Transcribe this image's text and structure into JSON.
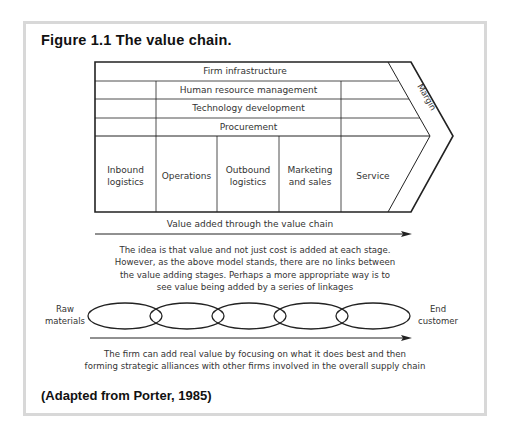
{
  "figure": {
    "title": "Figure 1.1  The value chain.",
    "source": "(Adapted from Porter, 1985)"
  },
  "value_chain": {
    "support_activities": [
      "Firm infrastructure",
      "Human resource management",
      "Technology development",
      "Procurement"
    ],
    "primary_activities": [
      {
        "line1": "Inbound",
        "line2": "logistics"
      },
      {
        "line1": "Operations",
        "line2": ""
      },
      {
        "line1": "Outbound",
        "line2": "logistics"
      },
      {
        "line1": "Marketing",
        "line2": "and sales"
      },
      {
        "line1": "Service",
        "line2": ""
      }
    ],
    "margin_label": "Margin",
    "arrow_label": "Value added through the value chain"
  },
  "explanation": {
    "lines": [
      "The idea is that value and not just cost is added at each stage.",
      "However, as the above model stands, there are no links between",
      "the value adding stages. Perhaps a more appropriate way is to",
      "see value being added by a series of linkages"
    ]
  },
  "linkages": {
    "start_label_1": "Raw",
    "start_label_2": "materials",
    "end_label_1": "End",
    "end_label_2": "customer",
    "link_count": 5
  },
  "conclusion": {
    "lines": [
      "The firm can add real value by focusing on what it does best and then",
      "forming strategic alliances with other firms involved in the overall supply chain"
    ]
  }
}
